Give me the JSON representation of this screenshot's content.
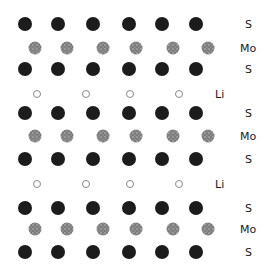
{
  "legend": {
    "S": {
      "label": "S",
      "style": "solid-dark",
      "color": "#1c1c1c"
    },
    "Mo": {
      "label": "Mo",
      "style": "speckled-gray",
      "color": "#7a7a7a"
    },
    "Li": {
      "label": "Li",
      "style": "hollow-ring",
      "color": "#8a8a8a"
    }
  },
  "layers": [
    {
      "element": "S",
      "label": "S",
      "count": 6
    },
    {
      "element": "Mo",
      "label": "Mo",
      "count": 6
    },
    {
      "element": "S",
      "label": "S",
      "count": 6
    },
    {
      "element": "Li",
      "label": "Li",
      "count": 4
    },
    {
      "element": "S",
      "label": "S",
      "count": 6
    },
    {
      "element": "Mo",
      "label": "Mo",
      "count": 6
    },
    {
      "element": "S",
      "label": "S",
      "count": 6
    },
    {
      "element": "Li",
      "label": "Li",
      "count": 4
    },
    {
      "element": "S",
      "label": "S",
      "count": 6
    },
    {
      "element": "Mo",
      "label": "Mo",
      "count": 6
    },
    {
      "element": "S",
      "label": "S",
      "count": 6
    }
  ]
}
